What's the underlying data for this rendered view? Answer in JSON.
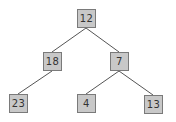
{
  "diagram": {
    "type": "binary-tree",
    "nodes": [
      {
        "id": "n12",
        "label": "12",
        "x": 77,
        "y": 9
      },
      {
        "id": "n18",
        "label": "18",
        "x": 43,
        "y": 52
      },
      {
        "id": "n7",
        "label": "7",
        "x": 110,
        "y": 52
      },
      {
        "id": "n23",
        "label": "23",
        "x": 9,
        "y": 94
      },
      {
        "id": "n4",
        "label": "4",
        "x": 77,
        "y": 94
      },
      {
        "id": "n13",
        "label": "13",
        "x": 144,
        "y": 95
      }
    ],
    "edges": [
      {
        "from": "12",
        "to": "18"
      },
      {
        "from": "12",
        "to": "7"
      },
      {
        "from": "18",
        "to": "23"
      },
      {
        "from": "7",
        "to": "4"
      },
      {
        "from": "7",
        "to": "13"
      }
    ],
    "colors": {
      "node_fill": "#c8c8c8",
      "node_border": "#7a7a7a",
      "edge": "#555555"
    }
  }
}
